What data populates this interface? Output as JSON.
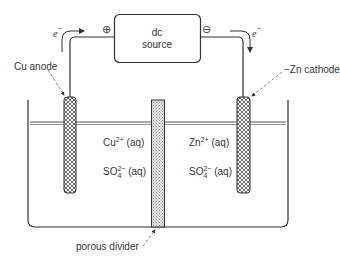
{
  "diagram": {
    "power_supply": {
      "line1": "dc",
      "line2": "source",
      "positive_terminal": "⊕",
      "negative_terminal": "⊖"
    },
    "electron_flow": {
      "left_label": "e",
      "right_label": "e",
      "charge": "−"
    },
    "electrodes": {
      "anode": {
        "label": "Cu  anode"
      },
      "cathode": {
        "label": "Zn cathode"
      }
    },
    "left_compartment": {
      "ion1_base": "Cu",
      "ion1_charge": "2+",
      "ion1_state": " (aq)",
      "ion2_base": "SO",
      "ion2_sub": "4",
      "ion2_charge": "2−",
      "ion2_state": " (aq)"
    },
    "right_compartment": {
      "ion1_base": "Zn",
      "ion1_charge": "2+",
      "ion1_state": " (aq)",
      "ion2_base": "SO",
      "ion2_sub": "4",
      "ion2_charge": "2−",
      "ion2_state": " (aq)"
    },
    "divider": {
      "label": "porous  divider"
    },
    "colors": {
      "line": "#333333",
      "electrode_fill": "#9a9a9a",
      "divider_fill": "#c8c8c8"
    }
  }
}
